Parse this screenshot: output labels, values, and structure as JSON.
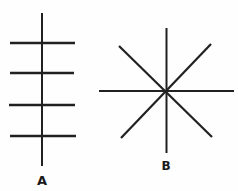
{
  "colors": {
    "background": "#fefefe",
    "line": "#212121",
    "label": "#1a1a1a"
  },
  "figures": [
    {
      "name": "figure-a",
      "label": "A",
      "label_x": 42,
      "label_y": 185,
      "label_size": 13,
      "lines": [
        {
          "name": "vertical-stem-line",
          "x1": 42,
          "y1": 13,
          "x2": 42,
          "y2": 166,
          "w": 2
        },
        {
          "name": "crossbar-1",
          "x1": 10,
          "y1": 43,
          "x2": 75,
          "y2": 43,
          "w": 2.6
        },
        {
          "name": "crossbar-2",
          "x1": 10,
          "y1": 73,
          "x2": 74,
          "y2": 73,
          "w": 2.6
        },
        {
          "name": "crossbar-3",
          "x1": 9,
          "y1": 105,
          "x2": 75,
          "y2": 105,
          "w": 2.6
        },
        {
          "name": "crossbar-4",
          "x1": 10,
          "y1": 136,
          "x2": 76,
          "y2": 136,
          "w": 2.6
        }
      ]
    },
    {
      "name": "figure-b",
      "label": "B",
      "label_x": 166,
      "label_y": 170,
      "label_size": 12,
      "lines": [
        {
          "name": "vertical-ray-line",
          "x1": 166.5,
          "y1": 28,
          "x2": 166.5,
          "y2": 153,
          "w": 2
        },
        {
          "name": "horizontal-ray-line",
          "x1": 99,
          "y1": 91,
          "x2": 234,
          "y2": 91,
          "w": 2.2
        },
        {
          "name": "diagonal-nw-se-line",
          "x1": 119,
          "y1": 46,
          "x2": 212,
          "y2": 137,
          "w": 2.2
        },
        {
          "name": "diagonal-ne-sw-line",
          "x1": 211,
          "y1": 44,
          "x2": 121,
          "y2": 138,
          "w": 2.2
        }
      ]
    }
  ]
}
